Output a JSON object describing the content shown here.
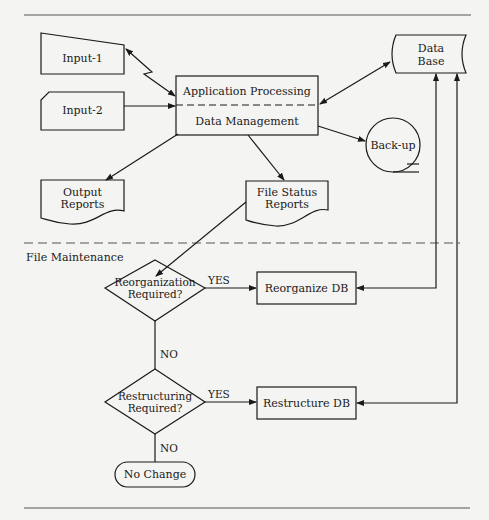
{
  "diagram": {
    "section_label": "File Maintenance",
    "nodes": {
      "input1": {
        "label": "Input-1",
        "shape": "manual-input"
      },
      "input2": {
        "label": "Input-2",
        "shape": "punched-card"
      },
      "app_processing": {
        "label": "Application Processing",
        "shape": "process-upper"
      },
      "data_management": {
        "label": "Data Management",
        "shape": "process-lower"
      },
      "database": {
        "line1": "Data",
        "line2": "Base",
        "shape": "stored-data"
      },
      "backup": {
        "label": "Back-up",
        "shape": "magnetic-tape"
      },
      "output_reports": {
        "line1": "Output",
        "line2": "Reports",
        "shape": "document"
      },
      "file_status_reports": {
        "line1": "File Status",
        "line2": "Reports",
        "shape": "document"
      },
      "reorg_decision": {
        "line1": "Reorganization",
        "line2": "Required?",
        "shape": "decision"
      },
      "reorganize_db": {
        "label": "Reorganize DB",
        "shape": "process"
      },
      "restruct_decision": {
        "line1": "Restructuring",
        "line2": "Required?",
        "shape": "decision"
      },
      "restructure_db": {
        "label": "Restructure DB",
        "shape": "process"
      },
      "no_change": {
        "label": "No Change",
        "shape": "terminal"
      }
    },
    "edge_labels": {
      "reorg_yes": "YES",
      "reorg_no": "NO",
      "restruct_yes": "YES",
      "restruct_no": "NO"
    },
    "edges": [
      {
        "from": "input1",
        "to": "app_processing",
        "style": "communication-link",
        "bidirectional": true
      },
      {
        "from": "input2",
        "to": "app_processing"
      },
      {
        "from": "app_processing",
        "to": "database",
        "bidirectional": true
      },
      {
        "from": "data_management",
        "to": "backup"
      },
      {
        "from": "data_management",
        "to": "output_reports"
      },
      {
        "from": "data_management",
        "to": "file_status_reports"
      },
      {
        "from": "file_status_reports",
        "to": "reorg_decision"
      },
      {
        "from": "reorg_decision",
        "to": "reorganize_db",
        "label": "YES"
      },
      {
        "from": "reorg_decision",
        "to": "restruct_decision",
        "label": "NO"
      },
      {
        "from": "restruct_decision",
        "to": "restructure_db",
        "label": "YES"
      },
      {
        "from": "restruct_decision",
        "to": "no_change",
        "label": "NO"
      },
      {
        "from": "database",
        "to": "reorganize_db",
        "bidirectional": true
      },
      {
        "from": "database",
        "to": "restructure_db",
        "bidirectional": true
      }
    ],
    "colors": {
      "ink": "#1a1a1a",
      "paper": "#f4f4f2"
    }
  }
}
